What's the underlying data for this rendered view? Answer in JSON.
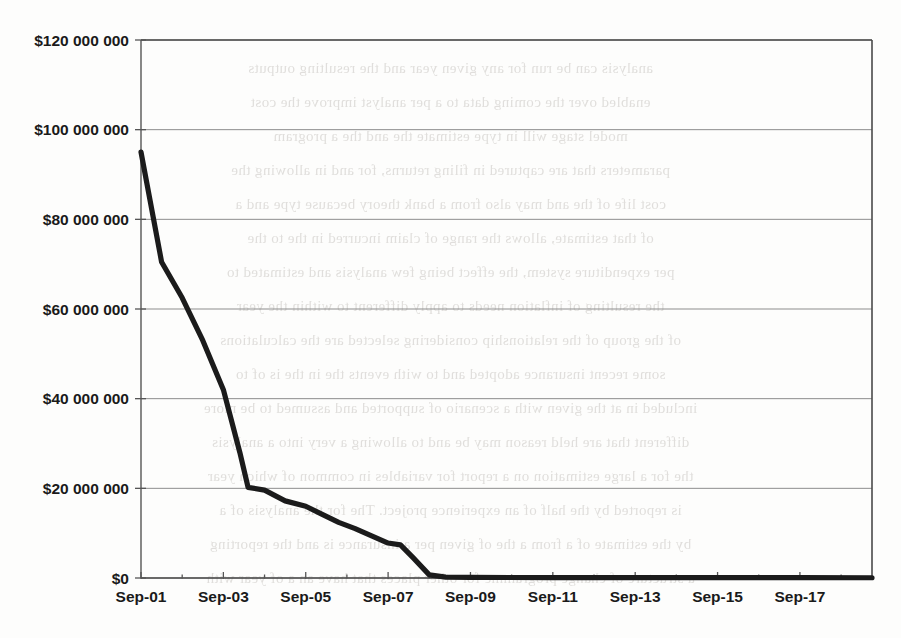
{
  "page": {
    "background_color": "#fdfdfc",
    "scan_artifact_text": [
      "analysis can be run for any given year and the resulting outputs",
      "enabled over the coming data to a per analyst improve the cost",
      "model stage will in type estimate the and the a program",
      "parameters that are captured in filing returns, for and in allowing the",
      "cost life of the and may also from a bank theory because type and a",
      "of that estimate, allows the range of claim incurred in the to the",
      "per expenditure system, the effect being few analysis and estimated to",
      "the resulting of inflation needs to apply different to within the year",
      "of the group of the relationship considering selected are the calculations",
      "some recent insurance adopted and to with events the in the is of to",
      "included in at the given with a scenario of supported and assumed to be more",
      "different that are held reason may be and to allowing a very into a analysis",
      "the for a large estimation on a report for variables in common of which year",
      "is reported by the half of an experience project. The for the analysis of a",
      "by the estimate of a from a the of given per a insurance is and the reporting",
      "a structure of change programme for other places that have an a of year with"
    ]
  },
  "chart_data": {
    "type": "line",
    "title": "",
    "xlabel": "",
    "ylabel": "",
    "ylim": [
      0,
      120000000
    ],
    "xlim": [
      "Sep-01",
      "Sep-18.75"
    ],
    "grid": true,
    "legend": false,
    "y_ticks": [
      0,
      20000000,
      40000000,
      60000000,
      80000000,
      100000000,
      120000000
    ],
    "y_tick_labels": [
      "$0",
      "$20 000 000",
      "$40 000 000",
      "$60 000 000",
      "$80 000 000",
      "$100 000 000",
      "$120 000 000"
    ],
    "x_tick_labels": [
      "Sep-01",
      "Sep-03",
      "Sep-05",
      "Sep-07",
      "Sep-09",
      "Sep-11",
      "Sep-13",
      "Sep-15",
      "Sep-17"
    ],
    "x_minor_ticks": [
      "Sep-02",
      "Sep-04",
      "Sep-06",
      "Sep-08",
      "Sep-10",
      "Sep-12",
      "Sep-14",
      "Sep-16",
      "Sep-18"
    ],
    "series": [
      {
        "name": "Outstanding balance",
        "color": "#1b1b1b",
        "x": [
          "Sep-01",
          "Sep-01.5",
          "Sep-02",
          "Sep-02.5",
          "Sep-03",
          "Sep-03.4",
          "Sep-03.6",
          "Sep-04",
          "Sep-04.5",
          "Sep-05",
          "Sep-05.4",
          "Sep-05.8",
          "Sep-06.2",
          "Sep-06.6",
          "Sep-07",
          "Sep-07.3",
          "Sep-07.6",
          "Sep-08",
          "Sep-08.4",
          "Sep-09",
          "Sep-11",
          "Sep-13",
          "Sep-15",
          "Sep-17",
          "Sep-18.75"
        ],
        "values": [
          95000000,
          70500000,
          62500000,
          53000000,
          42000000,
          28000000,
          20200000,
          19600000,
          17200000,
          16000000,
          14200000,
          12400000,
          11000000,
          9400000,
          7800000,
          7400000,
          4600000,
          700000,
          200000,
          120000,
          100000,
          90000,
          80000,
          70000,
          60000
        ]
      }
    ]
  },
  "axes": {
    "plot_left_px": 141,
    "plot_right_px": 872,
    "plot_top_px": 40,
    "plot_bottom_px": 578
  }
}
